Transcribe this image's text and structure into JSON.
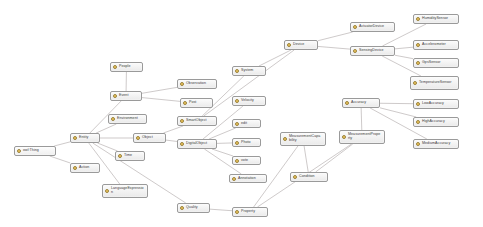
{
  "diagram": {
    "type": "ontology-class-graph",
    "background_color": "#ffffff",
    "node_fill_color": "#f2f2f2",
    "node_border_color": "#9a9a9a",
    "node_icon_color": "#f0c040",
    "edge_color": "#b9b3b3",
    "node_icon_name": "owl-class-icon"
  },
  "nodes": [
    {
      "id": "owl_thing",
      "label": "owl:Thing",
      "x": 14,
      "y": 146,
      "w": 42,
      "h": 10
    },
    {
      "id": "entity",
      "label": "Entity",
      "x": 70,
      "y": 133,
      "w": 30,
      "h": 10
    },
    {
      "id": "action",
      "label": "Action",
      "x": 70,
      "y": 163,
      "w": 30,
      "h": 10
    },
    {
      "id": "event",
      "label": "Event",
      "x": 110,
      "y": 91,
      "w": 32,
      "h": 10
    },
    {
      "id": "environment",
      "label": "Environment",
      "x": 108,
      "y": 114,
      "w": 39,
      "h": 10
    },
    {
      "id": "object",
      "label": "Object",
      "x": 133,
      "y": 133,
      "w": 33,
      "h": 10
    },
    {
      "id": "time",
      "label": "Time",
      "x": 115,
      "y": 151,
      "w": 30,
      "h": 10
    },
    {
      "id": "people",
      "label": "People",
      "x": 110,
      "y": 62,
      "w": 33,
      "h": 10
    },
    {
      "id": "language_expression",
      "label": "LanguageExpression",
      "x": 102,
      "y": 184,
      "w": 46,
      "h": 14
    },
    {
      "id": "observation",
      "label": "Observation",
      "x": 177,
      "y": 79,
      "w": 40,
      "h": 10
    },
    {
      "id": "post",
      "label": "Post",
      "x": 180,
      "y": 98,
      "w": 33,
      "h": 10
    },
    {
      "id": "smart_object",
      "label": "SmartObject",
      "x": 177,
      "y": 116,
      "w": 40,
      "h": 10
    },
    {
      "id": "digital_object",
      "label": "DigitalObject",
      "x": 177,
      "y": 139,
      "w": 40,
      "h": 10
    },
    {
      "id": "system",
      "label": "System",
      "x": 232,
      "y": 66,
      "w": 34,
      "h": 10
    },
    {
      "id": "velocity",
      "label": "Velocity",
      "x": 232,
      "y": 96,
      "w": 34,
      "h": 10
    },
    {
      "id": "edit",
      "label": "edit",
      "x": 232,
      "y": 119,
      "w": 29,
      "h": 9
    },
    {
      "id": "photo",
      "label": "Photo",
      "x": 232,
      "y": 138,
      "w": 29,
      "h": 9
    },
    {
      "id": "vote",
      "label": "vote",
      "x": 232,
      "y": 156,
      "w": 29,
      "h": 9
    },
    {
      "id": "annotation",
      "label": "Annotation",
      "x": 229,
      "y": 174,
      "w": 38,
      "h": 9
    },
    {
      "id": "quality",
      "label": "Quality",
      "x": 177,
      "y": 203,
      "w": 33,
      "h": 10
    },
    {
      "id": "property",
      "label": "Property",
      "x": 232,
      "y": 207,
      "w": 36,
      "h": 10
    },
    {
      "id": "device",
      "label": "Device",
      "x": 284,
      "y": 40,
      "w": 34,
      "h": 10
    },
    {
      "id": "actuator_device",
      "label": "ActuatorDevice",
      "x": 350,
      "y": 22,
      "w": 45,
      "h": 10
    },
    {
      "id": "sensing_device",
      "label": "SensingDevice",
      "x": 350,
      "y": 46,
      "w": 45,
      "h": 10
    },
    {
      "id": "humidity_sensor",
      "label": "HumiditySensor",
      "x": 413,
      "y": 14,
      "w": 46,
      "h": 10
    },
    {
      "id": "accelerometer",
      "label": "Accelerometer",
      "x": 413,
      "y": 40,
      "w": 46,
      "h": 10
    },
    {
      "id": "gps_sensor",
      "label": "GpsSensor",
      "x": 413,
      "y": 58,
      "w": 46,
      "h": 10
    },
    {
      "id": "temperature_sensor",
      "label": "TemperatureSensor",
      "x": 410,
      "y": 76,
      "w": 49,
      "h": 14
    },
    {
      "id": "accuracy",
      "label": "Accuracy",
      "x": 342,
      "y": 98,
      "w": 38,
      "h": 10
    },
    {
      "id": "low_accuracy",
      "label": "LowAccuracy",
      "x": 413,
      "y": 99,
      "w": 46,
      "h": 10
    },
    {
      "id": "high_accuracy",
      "label": "HighAccuracy",
      "x": 413,
      "y": 117,
      "w": 46,
      "h": 10
    },
    {
      "id": "medium_accuracy",
      "label": "MediumAccuracy",
      "x": 413,
      "y": 139,
      "w": 46,
      "h": 10
    },
    {
      "id": "measurement_capability",
      "label": "MeasurementCapability",
      "x": 280,
      "y": 132,
      "w": 46,
      "h": 14
    },
    {
      "id": "measurement_property",
      "label": "MeasurementProperty",
      "x": 339,
      "y": 130,
      "w": 46,
      "h": 14
    },
    {
      "id": "condition",
      "label": "Condition",
      "x": 290,
      "y": 172,
      "w": 38,
      "h": 10
    }
  ],
  "edges": [
    {
      "from": "owl_thing",
      "to": "entity"
    },
    {
      "from": "owl_thing",
      "to": "action"
    },
    {
      "from": "entity",
      "to": "event"
    },
    {
      "from": "entity",
      "to": "environment"
    },
    {
      "from": "entity",
      "to": "object"
    },
    {
      "from": "entity",
      "to": "time"
    },
    {
      "from": "entity",
      "to": "language_expression"
    },
    {
      "from": "entity",
      "to": "quality"
    },
    {
      "from": "event",
      "to": "people"
    },
    {
      "from": "event",
      "to": "observation"
    },
    {
      "from": "event",
      "to": "post"
    },
    {
      "from": "object",
      "to": "smart_object"
    },
    {
      "from": "object",
      "to": "digital_object"
    },
    {
      "from": "smart_object",
      "to": "system"
    },
    {
      "from": "smart_object",
      "to": "device"
    },
    {
      "from": "digital_object",
      "to": "velocity"
    },
    {
      "from": "digital_object",
      "to": "edit"
    },
    {
      "from": "digital_object",
      "to": "photo"
    },
    {
      "from": "digital_object",
      "to": "vote"
    },
    {
      "from": "digital_object",
      "to": "annotation"
    },
    {
      "from": "quality",
      "to": "property"
    },
    {
      "from": "device",
      "to": "actuator_device"
    },
    {
      "from": "device",
      "to": "sensing_device"
    },
    {
      "from": "sensing_device",
      "to": "humidity_sensor"
    },
    {
      "from": "sensing_device",
      "to": "accelerometer"
    },
    {
      "from": "sensing_device",
      "to": "gps_sensor"
    },
    {
      "from": "sensing_device",
      "to": "temperature_sensor"
    },
    {
      "from": "accuracy",
      "to": "low_accuracy"
    },
    {
      "from": "accuracy",
      "to": "high_accuracy"
    },
    {
      "from": "accuracy",
      "to": "medium_accuracy"
    },
    {
      "from": "accuracy",
      "to": "measurement_property"
    },
    {
      "from": "measurement_capability",
      "to": "condition"
    },
    {
      "from": "measurement_property",
      "to": "condition"
    },
    {
      "from": "measurement_property",
      "to": "property"
    },
    {
      "from": "property",
      "to": "measurement_capability"
    },
    {
      "from": "system",
      "to": "device"
    }
  ]
}
